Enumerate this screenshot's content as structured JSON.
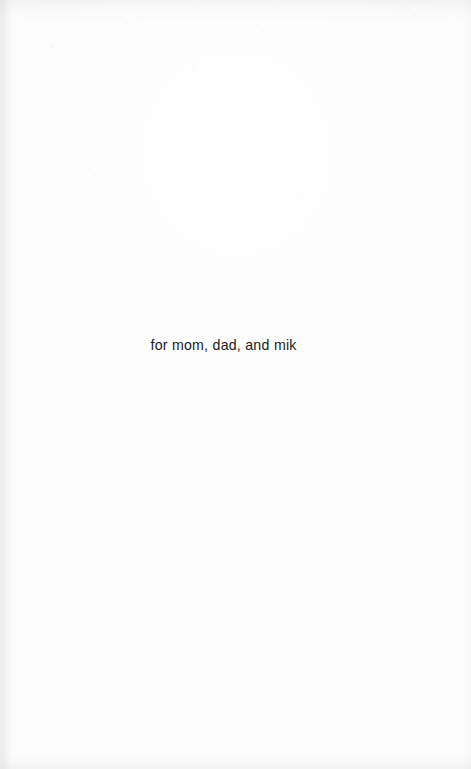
{
  "page": {
    "kind": "book-dedication-page",
    "width": 471,
    "height": 769,
    "background_color": "#fefefe",
    "paper_tone": "#fcfcfc",
    "scan_edge_shadow_color": "#b3b3b8"
  },
  "dedication": {
    "text": "for mom, dad, and mik",
    "text_color": "#1b1b1d",
    "font_size_px": 14,
    "alignment": "center",
    "baseline_y_px": 351
  }
}
